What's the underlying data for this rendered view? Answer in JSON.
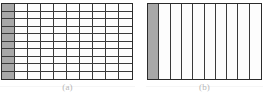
{
  "figure": {
    "background_color": "#ffffff",
    "line_color": "#3a3a3a",
    "shade_color": "#a8a8a8",
    "fill_color": "#fdfdfd",
    "caption_color": "#7e7e7e"
  },
  "panels": [
    {
      "id": "panel-a",
      "caption": "(a)",
      "columns": 10,
      "rows": 10,
      "total_cells": 100,
      "shaded_cells": 10,
      "shaded_region": "leftmost column",
      "shaded_fraction": "1/10"
    },
    {
      "id": "panel-b",
      "caption": "(b)",
      "columns": 10,
      "rows": 1,
      "total_cells": 10,
      "shaded_cells": 1,
      "shaded_region": "leftmost strip",
      "shaded_fraction": "1/10"
    }
  ],
  "chart_data": {
    "type": "table",
    "categories": [
      "(a)",
      "(b)"
    ],
    "series": [
      {
        "name": "columns",
        "values": [
          10,
          10
        ]
      },
      {
        "name": "rows",
        "values": [
          10,
          1
        ]
      },
      {
        "name": "total cells",
        "values": [
          100,
          10
        ]
      },
      {
        "name": "shaded cells",
        "values": [
          10,
          1
        ]
      },
      {
        "name": "shaded fraction",
        "values": [
          0.1,
          0.1
        ]
      }
    ],
    "xlabel": "",
    "ylabel": "",
    "grid": true,
    "legend": "none"
  }
}
